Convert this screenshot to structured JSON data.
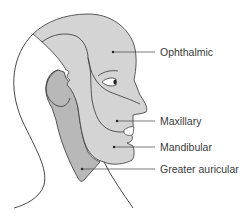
{
  "diagram": {
    "labels": [
      {
        "id": "ophthalmic",
        "text": "Ophthalmic"
      },
      {
        "id": "maxillary",
        "text": "Maxillary"
      },
      {
        "id": "mandibular",
        "text": "Mandibular"
      },
      {
        "id": "greater-auricular",
        "text": "Greater auricular"
      }
    ],
    "colors": {
      "background": "#ffffff",
      "face_region_fill": "#d4d4d4",
      "greater_auricular_fill": "#b8b8b8",
      "outline": "#333333",
      "leader_line": "#444444",
      "label_text": "#3a3a3a"
    }
  }
}
